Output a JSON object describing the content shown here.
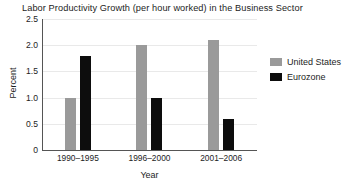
{
  "chart_data": {
    "type": "bar",
    "title": "Labor Productivity Growth (per hour worked) in the Business Sector",
    "xlabel": "Year",
    "ylabel": "Percent",
    "categories": [
      "1990–1995",
      "1996–2000",
      "2001–2006"
    ],
    "series": [
      {
        "name": "United States",
        "color": "#9a9a9a",
        "values": [
          1.0,
          2.0,
          2.1
        ]
      },
      {
        "name": "Eurozone",
        "color": "#0d0d0d",
        "values": [
          1.8,
          1.0,
          0.6
        ]
      }
    ],
    "ylim": [
      0,
      2.5
    ],
    "ytick_labels": [
      "2.5",
      "2.0",
      "1.5",
      "1.0",
      "0.5",
      "0"
    ],
    "ytick_values": [
      2.5,
      2.0,
      1.5,
      1.0,
      0.5,
      0
    ],
    "grid": "horizontal",
    "legend_position": "right"
  }
}
